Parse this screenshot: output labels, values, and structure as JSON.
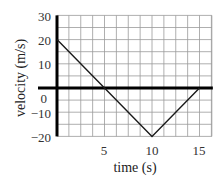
{
  "chart_data": {
    "type": "line",
    "title": "",
    "xlabel": "time (s)",
    "ylabel": "velocity (m/s)",
    "xlim": [
      0,
      16.3
    ],
    "ylim": [
      -20,
      30
    ],
    "x_ticks": [
      5,
      10,
      15
    ],
    "y_ticks": [
      30,
      20,
      10,
      0,
      -10,
      -20
    ],
    "grid": true,
    "x_grid_step": 1.25,
    "y_grid_step": 5,
    "series": [
      {
        "name": "velocity",
        "x": [
          0,
          5,
          10,
          15
        ],
        "y": [
          20,
          0,
          -20,
          0
        ]
      }
    ],
    "legend": null
  },
  "labels": {
    "xlabel": "time (s)",
    "ylabel": "velocity (m/s)",
    "x_tick_5": "5",
    "x_tick_10": "10",
    "x_tick_15": "15",
    "y_tick_30": "30",
    "y_tick_20": "20",
    "y_tick_10": "10",
    "y_tick_0": "0",
    "y_tick_m10": "−10",
    "y_tick_m20": "−20"
  },
  "colors": {
    "axis": "#000000",
    "grid": "#9a9a9a",
    "line": "#1a1a1a"
  }
}
